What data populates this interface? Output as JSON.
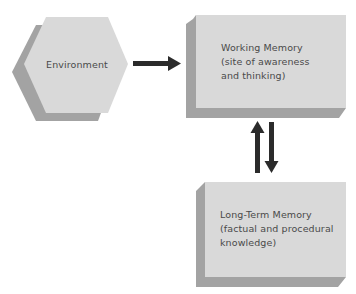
{
  "diagram": {
    "nodes": {
      "environment": {
        "shape": "hexagon",
        "label": "Environment"
      },
      "working_memory": {
        "shape": "box",
        "lines": [
          "Working Memory",
          "(site of awareness",
          "and thinking)"
        ]
      },
      "long_term_memory": {
        "shape": "box",
        "lines": [
          "Long-Term Memory",
          "(factual and procedural",
          "knowledge)"
        ]
      }
    },
    "edges": [
      {
        "from": "environment",
        "to": "working_memory",
        "direction": "right"
      },
      {
        "from": "long_term_memory",
        "to": "working_memory",
        "direction": "up"
      },
      {
        "from": "working_memory",
        "to": "long_term_memory",
        "direction": "down"
      }
    ],
    "colors": {
      "face": "#d9d9d9",
      "shadow": "#a3a3a3",
      "shadow_dark": "#8f8f8f",
      "arrow": "#2b2b2b",
      "text": "#4a4a4a"
    }
  }
}
